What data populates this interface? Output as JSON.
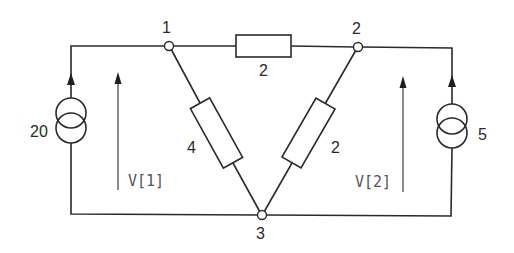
{
  "diagram": {
    "type": "electrical-circuit",
    "nodes": [
      {
        "id": "node1",
        "label": "1"
      },
      {
        "id": "node2",
        "label": "2"
      },
      {
        "id": "node3",
        "label": "3"
      }
    ],
    "resistors": [
      {
        "id": "r12",
        "between": [
          "1",
          "2"
        ],
        "label": "2"
      },
      {
        "id": "r13",
        "between": [
          "1",
          "3"
        ],
        "label": "4"
      },
      {
        "id": "r23",
        "between": [
          "2",
          "3"
        ],
        "label": "2"
      }
    ],
    "sources": [
      {
        "id": "left-source",
        "type": "current-source",
        "label": "20",
        "into_node": "1"
      },
      {
        "id": "right-source",
        "type": "current-source",
        "label": "5",
        "into_node": "2"
      }
    ],
    "voltages": [
      {
        "id": "v1",
        "label": "V[1]"
      },
      {
        "id": "v2",
        "label": "V[2]"
      }
    ],
    "colors": {
      "line": "#2a2a2a",
      "voltage_label": "#555555",
      "background": "#ffffff"
    }
  }
}
